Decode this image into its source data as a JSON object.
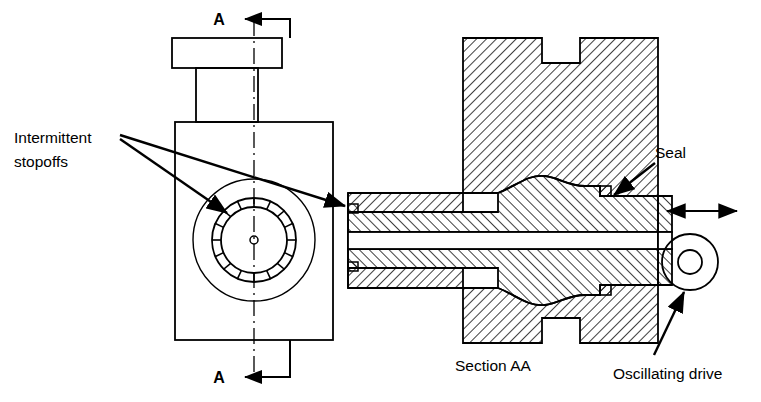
{
  "figure": {
    "type": "engineering-section-drawing",
    "background_color": "#ffffff",
    "line_color": "#000000"
  },
  "labels": {
    "intermittent_stopoffs_line1": "Intermittent",
    "intermittent_stopoffs_line2": "stopoffs",
    "seal": "Seal",
    "oscillating_drive": "Oscillating drive",
    "section_caption": "Section AA",
    "section_mark_top": "A",
    "section_mark_bottom": "A"
  },
  "plan_view": {
    "name": "plan-view",
    "cap": {
      "x": 172,
      "y": 38,
      "w": 110,
      "h": 30
    },
    "neck": {
      "x": 196,
      "y": 68,
      "w": 62,
      "h": 54
    },
    "body": {
      "x": 175,
      "y": 122,
      "w": 158,
      "h": 218
    },
    "center_axis_x": 254,
    "outer_circle_r": 61,
    "ring_outer_r": 42,
    "ring_inner_r": 33,
    "hub_r": 4,
    "stopoff_segments": 16,
    "circle_center": {
      "x": 254,
      "y": 240
    }
  },
  "section_view": {
    "name": "section-aa-view",
    "hatch_angle_deg": 45,
    "hatch_spacing_px": 7,
    "shaft_axis_y": 240,
    "seal_notch": {
      "x": 600,
      "y": 196
    },
    "drive_wheel": {
      "cx": 690,
      "cy": 262,
      "r_outer": 28,
      "r_inner": 12
    },
    "motion_arrow": {
      "x1": 662,
      "y1": 211,
      "x2": 740,
      "y2": 211,
      "double_headed": true
    }
  }
}
